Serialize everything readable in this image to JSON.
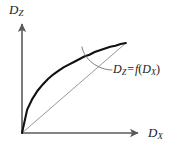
{
  "figure": {
    "background_color": "#ffffff",
    "axis_color": "#5a5a5a",
    "curve_color": "#111111",
    "chord_color": "#8c8c8c",
    "leader_color": "#6e6e6e",
    "text_color": "#1a1a1a",
    "width": 189,
    "height": 150
  },
  "axes": {
    "y_label": {
      "variable": "D",
      "subscript": "Z"
    },
    "x_label": {
      "variable": "D",
      "subscript": "X"
    },
    "origin": {
      "x": 22,
      "y": 133
    },
    "y_axis_tip": {
      "x": 22,
      "y": 22
    },
    "x_axis_tip": {
      "x": 140,
      "y": 133
    }
  },
  "annotation": {
    "equation": {
      "lhs_variable": "D",
      "lhs_subscript": "Z",
      "operator": "=",
      "function_name": "f",
      "open_paren": "(",
      "arg_variable": "D",
      "arg_subscript": "X",
      "close_paren": ")"
    },
    "leader_start": {
      "x": 82,
      "y": 47
    },
    "leader_end": {
      "x": 112,
      "y": 70
    }
  },
  "chart_data": {
    "type": "line",
    "title": "",
    "xlabel": "D_X",
    "ylabel": "D_Z",
    "xlim": [
      0,
      1
    ],
    "ylim": [
      0,
      1
    ],
    "grid": false,
    "legend": null,
    "annotations": [
      "D_Z = f(D_X)"
    ],
    "series": [
      {
        "name": "D_Z = f(D_X)",
        "style": "solid-bold",
        "x": [
          0.0,
          0.05,
          0.1,
          0.15,
          0.2,
          0.25,
          0.3,
          0.35,
          0.4,
          0.45,
          0.5,
          0.55,
          0.6,
          0.65,
          0.7,
          0.75,
          0.8,
          0.85,
          0.9,
          0.95,
          1.0
        ],
        "y": [
          0.0,
          0.26,
          0.38,
          0.47,
          0.54,
          0.6,
          0.65,
          0.69,
          0.73,
          0.76,
          0.79,
          0.82,
          0.85,
          0.87,
          0.9,
          0.92,
          0.94,
          0.96,
          0.97,
          0.99,
          1.0
        ]
      },
      {
        "name": "chord",
        "style": "solid-thin",
        "x": [
          0.0,
          1.0
        ],
        "y": [
          0.0,
          1.0
        ]
      }
    ]
  }
}
